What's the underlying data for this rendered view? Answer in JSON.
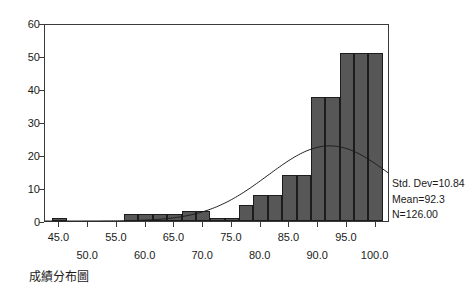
{
  "caption": "成績分布圖",
  "stats": {
    "std_dev": "Std. Dev=10.84",
    "mean": "Mean=92.3",
    "n": "N=126.00"
  },
  "chart_data": {
    "type": "bar",
    "title": "成績分布圖",
    "xlabel": "",
    "ylabel": "",
    "xlim": [
      42.5,
      102.5
    ],
    "ylim": [
      0,
      60
    ],
    "grid": false,
    "legend": null,
    "bin_width": 2.5,
    "y_ticks": [
      0,
      10,
      20,
      30,
      40,
      50,
      60
    ],
    "y_tick_labels": [
      "0",
      "10",
      "20",
      "30",
      "40",
      "50",
      "60"
    ],
    "x_ticks": [
      45.0,
      50.0,
      55.0,
      60.0,
      65.0,
      70.0,
      75.0,
      80.0,
      85.0,
      90.0,
      95.0,
      100.0
    ],
    "x_tick_labels_upper": [
      "45.0",
      "55.0",
      "65.0",
      "75.0",
      "85.0",
      "95.0"
    ],
    "x_tick_labels_lower": [
      "50.0",
      "60.0",
      "70.0",
      "80.0",
      "90.0",
      "100.0"
    ],
    "bar_color": "#575757",
    "bar_edge_color": "#1c1c1c",
    "bin_centers": [
      45.0,
      47.5,
      50.0,
      52.5,
      55.0,
      57.5,
      60.0,
      62.5,
      65.0,
      67.5,
      70.0,
      72.5,
      75.0,
      77.5,
      80.0,
      82.5,
      85.0,
      87.5,
      90.0,
      92.5,
      95.0,
      97.5,
      100.0
    ],
    "values": [
      1,
      0,
      0,
      0,
      0,
      2,
      2,
      2,
      2,
      3,
      3,
      1,
      1,
      5,
      8,
      8,
      14,
      14,
      37.5,
      37.5,
      51,
      51,
      51
    ],
    "overlay_curve": {
      "type": "line",
      "name": "normal",
      "mean": 92.3,
      "std_dev": 10.84,
      "n": 126,
      "peak_value": 23,
      "color": "#1c1c1c"
    }
  }
}
